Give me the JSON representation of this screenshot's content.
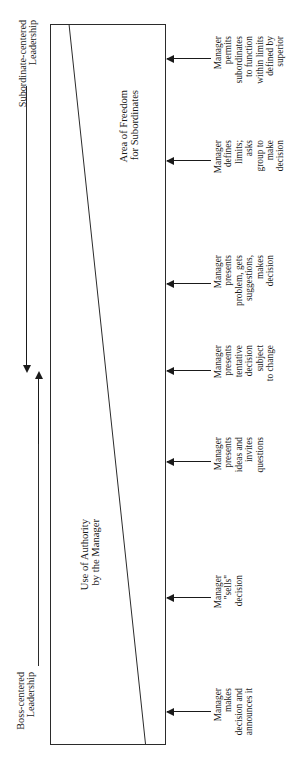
{
  "diagram": {
    "orientation": "rotated-90",
    "poles": {
      "top": {
        "line1": "Subordinate-centered",
        "line2": "Leadership"
      },
      "bottom": {
        "line1": "Boss-centered",
        "line2": "Leadership"
      }
    },
    "regions": {
      "authority": {
        "line1": "Use of Authority",
        "line2": "by the Manager"
      },
      "freedom": {
        "line1": "Area of Freedom",
        "line2": "for Subordinates"
      }
    },
    "steps": [
      {
        "id": "step-7",
        "lines": [
          "Manager",
          "permits",
          "subordinates",
          "to function",
          "within limits",
          "defined by",
          "superior"
        ]
      },
      {
        "id": "step-6",
        "lines": [
          "Manager",
          "defines",
          "limits;",
          "asks",
          "group to",
          "make",
          "decision"
        ]
      },
      {
        "id": "step-5",
        "lines": [
          "Manager",
          "presents",
          "problem, gets",
          "suggestions,",
          "makes",
          "decision"
        ]
      },
      {
        "id": "step-4",
        "lines": [
          "Manager",
          "presents",
          "tentative",
          "decision",
          "subject",
          "to change"
        ]
      },
      {
        "id": "step-3",
        "lines": [
          "Manager",
          "presents",
          "ideas and",
          "invites",
          "questions"
        ]
      },
      {
        "id": "step-2",
        "lines": [
          "Manager",
          "\"sells\"",
          "decision"
        ]
      },
      {
        "id": "step-1",
        "lines": [
          "Manager",
          "makes",
          "decision and",
          "announces it"
        ]
      }
    ],
    "colors": {
      "ink": "#1a1a1a",
      "rule": "#2b2b2b",
      "paper": "#ffffff"
    }
  }
}
